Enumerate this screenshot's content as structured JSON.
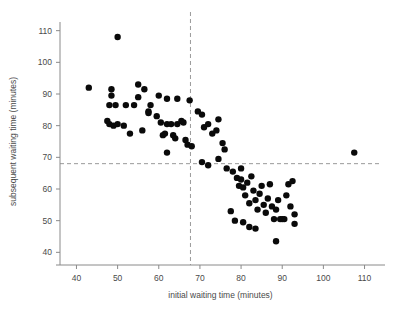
{
  "chart_data": {
    "type": "scatter",
    "title": "",
    "xlabel": "initial waiting time (minutes)",
    "ylabel": "subsequent waiting time (minutes)",
    "xlim": [
      36,
      114
    ],
    "ylim": [
      36,
      114
    ],
    "xticks": [
      40,
      50,
      60,
      70,
      80,
      90,
      100,
      110
    ],
    "yticks": [
      40,
      50,
      60,
      70,
      80,
      90,
      100,
      110
    ],
    "grid": false,
    "legend": null,
    "marker": {
      "shape": "circle",
      "color": "#0a0a0a",
      "size": 3.2
    },
    "reference_lines": [
      {
        "orientation": "vertical",
        "value": 67.7,
        "style": "dashed",
        "color": "#9a9a9a"
      },
      {
        "orientation": "horizontal",
        "value": 68.0,
        "style": "dashed",
        "color": "#9a9a9a"
      }
    ],
    "points": [
      [
        43.0,
        92.0
      ],
      [
        50.0,
        108.0
      ],
      [
        48.5,
        91.5
      ],
      [
        48.5,
        89.5
      ],
      [
        48.0,
        86.5
      ],
      [
        49.5,
        86.5
      ],
      [
        52.0,
        86.5
      ],
      [
        54.0,
        86.5
      ],
      [
        55.0,
        93.0
      ],
      [
        55.0,
        89.0
      ],
      [
        56.5,
        91.5
      ],
      [
        57.5,
        84.5
      ],
      [
        58.0,
        86.5
      ],
      [
        60.0,
        89.5
      ],
      [
        62.0,
        88.5
      ],
      [
        64.5,
        88.5
      ],
      [
        67.5,
        88.0
      ],
      [
        69.5,
        84.5
      ],
      [
        47.5,
        81.5
      ],
      [
        48.0,
        80.5
      ],
      [
        49.0,
        80.0
      ],
      [
        50.0,
        80.5
      ],
      [
        51.5,
        80.0
      ],
      [
        53.0,
        77.5
      ],
      [
        56.0,
        78.5
      ],
      [
        57.5,
        84.0
      ],
      [
        59.5,
        83.0
      ],
      [
        60.5,
        81.0
      ],
      [
        61.0,
        77.0
      ],
      [
        61.5,
        77.5
      ],
      [
        62.0,
        80.5
      ],
      [
        63.0,
        80.5
      ],
      [
        63.5,
        77.0
      ],
      [
        64.0,
        76.0
      ],
      [
        64.5,
        80.5
      ],
      [
        65.5,
        81.5
      ],
      [
        66.0,
        81.0
      ],
      [
        66.5,
        75.5
      ],
      [
        67.0,
        74.0
      ],
      [
        68.0,
        73.5
      ],
      [
        62.0,
        71.5
      ],
      [
        70.5,
        83.5
      ],
      [
        71.0,
        79.5
      ],
      [
        72.0,
        80.5
      ],
      [
        73.0,
        77.5
      ],
      [
        74.0,
        78.5
      ],
      [
        74.5,
        82.0
      ],
      [
        75.5,
        74.5
      ],
      [
        76.0,
        72.5
      ],
      [
        70.5,
        68.5
      ],
      [
        72.0,
        67.5
      ],
      [
        74.5,
        69.5
      ],
      [
        76.5,
        66.5
      ],
      [
        78.0,
        65.5
      ],
      [
        79.0,
        63.5
      ],
      [
        79.5,
        61.0
      ],
      [
        80.0,
        66.5
      ],
      [
        80.0,
        63.0
      ],
      [
        80.5,
        60.5
      ],
      [
        81.0,
        58.0
      ],
      [
        81.5,
        62.0
      ],
      [
        82.0,
        55.5
      ],
      [
        82.5,
        64.0
      ],
      [
        83.0,
        59.5
      ],
      [
        83.5,
        56.5
      ],
      [
        84.0,
        53.5
      ],
      [
        84.5,
        58.5
      ],
      [
        85.0,
        61.0
      ],
      [
        85.5,
        55.0
      ],
      [
        86.0,
        52.5
      ],
      [
        86.5,
        57.0
      ],
      [
        87.0,
        61.5
      ],
      [
        87.5,
        54.5
      ],
      [
        88.0,
        50.5
      ],
      [
        88.5,
        53.5
      ],
      [
        89.0,
        56.5
      ],
      [
        89.5,
        50.5
      ],
      [
        90.0,
        50.5
      ],
      [
        90.5,
        50.5
      ],
      [
        91.0,
        58.0
      ],
      [
        91.5,
        61.5
      ],
      [
        92.0,
        54.5
      ],
      [
        92.5,
        62.5
      ],
      [
        93.0,
        52.0
      ],
      [
        93.0,
        49.0
      ],
      [
        77.5,
        53.0
      ],
      [
        78.5,
        50.0
      ],
      [
        80.5,
        49.5
      ],
      [
        82.0,
        48.0
      ],
      [
        83.5,
        47.5
      ],
      [
        88.5,
        43.5
      ],
      [
        107.5,
        71.5
      ]
    ]
  }
}
